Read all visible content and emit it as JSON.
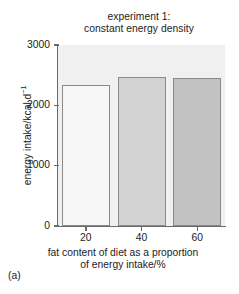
{
  "panel_label": "(a)",
  "chart_data": {
    "type": "bar",
    "title": "experiment 1: constant energy density",
    "title_lines": [
      "experiment 1:",
      "constant energy density"
    ],
    "xlabel": "fat content of diet as a proportion of energy intake/%",
    "xlabel_lines": [
      "fat content of diet as a proportion",
      "of energy intake/%"
    ],
    "ylabel": "energy intake/kcal d⁻¹",
    "ylabel_base": "energy intake/kcal d",
    "ylabel_sup": "−1",
    "categories": [
      "20",
      "40",
      "60"
    ],
    "category_label": "fat content of diet as a proportion of energy intake/%",
    "values": [
      2330,
      2470,
      2450
    ],
    "value_unit": "kcal d⁻¹",
    "ylim": [
      0,
      3000
    ],
    "yticks": [
      0,
      1000,
      2000,
      3000
    ],
    "ytick_labels": [
      "0",
      "1000",
      "2000",
      "3000"
    ],
    "xtick_labels": [
      "20",
      "40",
      "60"
    ],
    "grid": false,
    "legend": false,
    "bar_colors": [
      "#f6f6f6",
      "#d2d2d2",
      "#c2c2c2"
    ],
    "bar_edge_color": "#8a8a8a",
    "plot_background": "#f0f0f0",
    "axis_color": "#6a6a6a",
    "text_color": "#1c1c1c"
  }
}
